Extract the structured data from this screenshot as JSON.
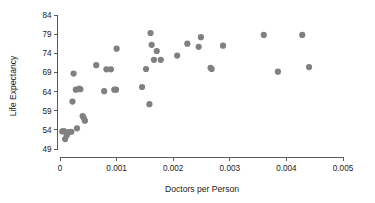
{
  "chart_data": {
    "type": "scatter",
    "title": "",
    "xlabel": "Doctors per Person",
    "ylabel": "Life Expectancy",
    "xlim": [
      0,
      0.005
    ],
    "ylim": [
      49,
      84
    ],
    "xticks": [
      0,
      0.001,
      0.002,
      0.003,
      0.004,
      0.005
    ],
    "xticklabels": [
      "0",
      "0.001",
      "0.002",
      "0.003",
      "0.004",
      "0.005"
    ],
    "yticks": [
      49,
      54,
      59,
      64,
      69,
      74,
      79,
      84
    ],
    "yticklabels": [
      "49",
      "54",
      "59",
      "64",
      "69",
      "74",
      "79",
      "84"
    ],
    "grid": false,
    "legend": null,
    "marker": {
      "shape": "circle",
      "color": "#808080",
      "size": 3.1
    },
    "points": [
      {
        "x": 4e-05,
        "y": 53.6
      },
      {
        "x": 7e-05,
        "y": 53.7
      },
      {
        "x": 9e-05,
        "y": 51.6
      },
      {
        "x": 0.00012,
        "y": 52.6
      },
      {
        "x": 0.00015,
        "y": 53.4
      },
      {
        "x": 0.0002,
        "y": 53.5
      },
      {
        "x": 0.00022,
        "y": 61.4
      },
      {
        "x": 0.00024,
        "y": 68.7
      },
      {
        "x": 0.00028,
        "y": 64.5
      },
      {
        "x": 0.0003,
        "y": 54.4
      },
      {
        "x": 0.00034,
        "y": 64.8
      },
      {
        "x": 0.00036,
        "y": 64.6
      },
      {
        "x": 0.0004,
        "y": 57.6
      },
      {
        "x": 0.00042,
        "y": 57.1
      },
      {
        "x": 0.00044,
        "y": 56.4
      },
      {
        "x": 0.00064,
        "y": 70.9
      },
      {
        "x": 0.00078,
        "y": 64.1
      },
      {
        "x": 0.00082,
        "y": 69.8
      },
      {
        "x": 0.0009,
        "y": 69.8
      },
      {
        "x": 0.00096,
        "y": 64.5
      },
      {
        "x": 0.00099,
        "y": 64.5
      },
      {
        "x": 0.001,
        "y": 75.2
      },
      {
        "x": 0.00145,
        "y": 65.2
      },
      {
        "x": 0.00152,
        "y": 69.9
      },
      {
        "x": 0.00158,
        "y": 60.7
      },
      {
        "x": 0.0016,
        "y": 79.3
      },
      {
        "x": 0.00162,
        "y": 76.2
      },
      {
        "x": 0.00166,
        "y": 72.3
      },
      {
        "x": 0.00171,
        "y": 74.6
      },
      {
        "x": 0.00178,
        "y": 72.3
      },
      {
        "x": 0.00207,
        "y": 73.4
      },
      {
        "x": 0.00225,
        "y": 76.5
      },
      {
        "x": 0.00245,
        "y": 75.7
      },
      {
        "x": 0.00249,
        "y": 78.2
      },
      {
        "x": 0.00266,
        "y": 70.2
      },
      {
        "x": 0.00268,
        "y": 69.9
      },
      {
        "x": 0.00288,
        "y": 76.0
      },
      {
        "x": 0.0036,
        "y": 78.8
      },
      {
        "x": 0.00385,
        "y": 69.2
      },
      {
        "x": 0.00428,
        "y": 78.8
      },
      {
        "x": 0.0044,
        "y": 70.4
      }
    ]
  },
  "axes": {
    "x_axis_name": "x-axis",
    "y_axis_name": "y-axis"
  }
}
